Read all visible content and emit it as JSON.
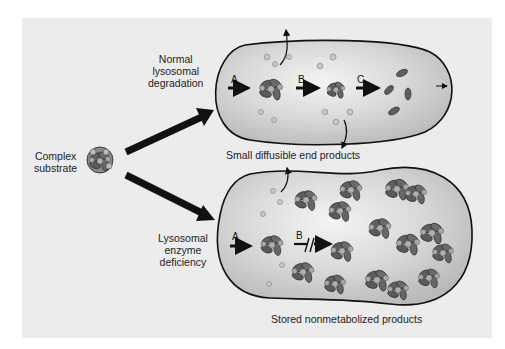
{
  "figure": {
    "labels": {
      "complex_substrate": [
        "Complex",
        "substrate"
      ],
      "normal": [
        "Normal",
        "lysosomal",
        "degradation"
      ],
      "deficiency": [
        "Lysosomal",
        "enzyme",
        "deficiency"
      ],
      "small_products": "Small diffusible end products",
      "stored_products": "Stored nonmetabolized products"
    },
    "steps_top": [
      "A",
      "B",
      "C"
    ],
    "steps_bottom": [
      "A",
      "B"
    ],
    "colors": {
      "background": "#ececec",
      "lysosome_fill": "#cfcfcf",
      "lysosome_highlight": "#f2f2f2",
      "outline": "#111111",
      "particle_dark": "#5e5e5e",
      "particle_light": "#a9a9a9"
    }
  }
}
